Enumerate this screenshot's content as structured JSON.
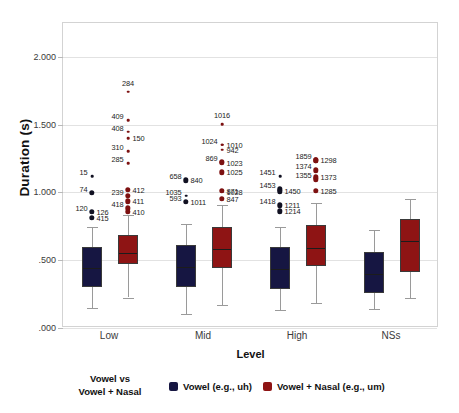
{
  "chart_data": {
    "type": "box",
    "title": "",
    "xlabel": "Level",
    "ylabel": "Duration (s)",
    "ylim": [
      0.0,
      2.25
    ],
    "yticks": [
      0.0,
      0.5,
      1.0,
      1.5,
      2.0
    ],
    "ytick_labels": [
      ".000",
      ".500",
      "1.000",
      "1.500",
      "2.000"
    ],
    "categories": [
      "Low",
      "Mid",
      "High",
      "NSs"
    ],
    "grid": true,
    "legend_position": "below-axis",
    "series": [
      {
        "name": "Vowel (e.g., uh)",
        "color": "#161642",
        "boxes": [
          {
            "category": "Low",
            "whisker_low": 0.145,
            "q1": 0.305,
            "median": 0.448,
            "q3": 0.595,
            "whisker_high": 0.745
          },
          {
            "category": "Mid",
            "whisker_low": 0.105,
            "q1": 0.3,
            "median": 0.455,
            "q3": 0.612,
            "whisker_high": 0.765
          },
          {
            "category": "High",
            "whisker_low": 0.135,
            "q1": 0.288,
            "median": 0.44,
            "q3": 0.598,
            "whisker_high": 0.745
          },
          {
            "category": "NSs",
            "whisker_low": 0.138,
            "q1": 0.258,
            "median": 0.408,
            "q3": 0.562,
            "whisker_high": 0.725
          }
        ]
      },
      {
        "name": "Vowel + Nasal (e.g., um)",
        "color": "#8e1414",
        "boxes": [
          {
            "category": "Low",
            "whisker_low": 0.225,
            "q1": 0.47,
            "median": 0.56,
            "q3": 0.688,
            "whisker_high": 0.832
          },
          {
            "category": "Mid",
            "whisker_low": 0.172,
            "q1": 0.442,
            "median": 0.592,
            "q3": 0.748,
            "whisker_high": 0.905
          },
          {
            "category": "High",
            "whisker_low": 0.182,
            "q1": 0.458,
            "median": 0.598,
            "q3": 0.762,
            "whisker_high": 0.925
          },
          {
            "category": "NSs",
            "whisker_low": 0.222,
            "q1": 0.412,
            "median": 0.652,
            "q3": 0.805,
            "whisker_high": 0.952
          }
        ]
      }
    ],
    "outliers": [
      {
        "group": "Low",
        "series": "Vowel",
        "label": "15",
        "value": 1.118,
        "size": "small",
        "label_side": "left"
      },
      {
        "group": "Low",
        "series": "Vowel",
        "label": "74",
        "value": 0.998,
        "size": "big",
        "label_side": "left"
      },
      {
        "group": "Low",
        "series": "Vowel",
        "label": "120",
        "value": 0.855,
        "size": "small",
        "label_side": "left"
      },
      {
        "group": "Low",
        "series": "Vowel",
        "label": "126",
        "value": 0.855,
        "size": "big",
        "label_side": "right"
      },
      {
        "group": "Low",
        "series": "Vowel",
        "label": "415",
        "value": 0.812,
        "size": "big",
        "label_side": "right"
      },
      {
        "group": "Low",
        "series": "Vowel + Nasal",
        "label": "284",
        "value": 1.742,
        "size": "small",
        "label_side": "center"
      },
      {
        "group": "Low",
        "series": "Vowel + Nasal",
        "label": "409",
        "value": 1.532,
        "size": "small",
        "label_side": "left"
      },
      {
        "group": "Low",
        "series": "Vowel + Nasal",
        "label": "408",
        "value": 1.448,
        "size": "small",
        "label_side": "left"
      },
      {
        "group": "Low",
        "series": "Vowel + Nasal",
        "label": "150",
        "value": 1.402,
        "size": "small",
        "label_side": "right"
      },
      {
        "group": "Low",
        "series": "Vowel + Nasal",
        "label": "310",
        "value": 1.305,
        "size": "small",
        "label_side": "left"
      },
      {
        "group": "Low",
        "series": "Vowel + Nasal",
        "label": "285",
        "value": 1.215,
        "size": "small",
        "label_side": "left"
      },
      {
        "group": "Low",
        "series": "Vowel + Nasal",
        "label": "412",
        "value": 1.018,
        "size": "big",
        "label_side": "right"
      },
      {
        "group": "Low",
        "series": "Vowel + Nasal",
        "label": "239",
        "value": 0.975,
        "size": "big",
        "label_side": "left"
      },
      {
        "group": "Low",
        "series": "Vowel + Nasal",
        "label": "411",
        "value": 0.935,
        "size": "big",
        "label_side": "right"
      },
      {
        "group": "Low",
        "series": "Vowel + Nasal",
        "label": "418",
        "value": 0.882,
        "size": "big",
        "label_side": "left"
      },
      {
        "group": "Low",
        "series": "Vowel + Nasal",
        "label": "410",
        "value": 0.858,
        "size": "big",
        "label_side": "right"
      },
      {
        "group": "Mid",
        "series": "Vowel",
        "label": "658",
        "value": 1.09,
        "size": "big",
        "label_side": "left"
      },
      {
        "group": "Mid",
        "series": "Vowel",
        "label": "593",
        "value": 0.932,
        "size": "big",
        "label_side": "left"
      },
      {
        "group": "Mid",
        "series": "Vowel",
        "label": "840",
        "value": 1.09,
        "size": "small",
        "label_side": "right"
      },
      {
        "group": "Mid",
        "series": "Vowel",
        "label": "1011",
        "value": 0.932,
        "size": "small",
        "label_side": "right"
      },
      {
        "group": "Mid",
        "series": "Vowel",
        "label": "1035",
        "value": 0.975,
        "size": "small",
        "label_side": "left"
      },
      {
        "group": "Mid",
        "series": "Vowel + Nasal",
        "label": "1016",
        "value": 1.505,
        "size": "small",
        "label_side": "center"
      },
      {
        "group": "Mid",
        "series": "Vowel + Nasal",
        "label": "1024",
        "value": 1.352,
        "size": "small",
        "label_side": "left"
      },
      {
        "group": "Mid",
        "series": "Vowel + Nasal",
        "label": "1010",
        "value": 1.352,
        "size": "small",
        "label_side": "right"
      },
      {
        "group": "Mid",
        "series": "Vowel + Nasal",
        "label": "942",
        "value": 1.315,
        "size": "small",
        "label_side": "right"
      },
      {
        "group": "Mid",
        "series": "Vowel + Nasal",
        "label": "869",
        "value": 1.228,
        "size": "big",
        "label_side": "left"
      },
      {
        "group": "Mid",
        "series": "Vowel + Nasal",
        "label": "1023",
        "value": 1.218,
        "size": "big",
        "label_side": "right"
      },
      {
        "group": "Mid",
        "series": "Vowel + Nasal",
        "label": "1025",
        "value": 1.148,
        "size": "big",
        "label_side": "right"
      },
      {
        "group": "Mid",
        "series": "Vowel + Nasal",
        "label": "871",
        "value": 1.012,
        "size": "big",
        "label_side": "right"
      },
      {
        "group": "Mid",
        "series": "Vowel + Nasal",
        "label": "1028",
        "value": 1.005,
        "size": "small",
        "label_side": "right"
      },
      {
        "group": "Mid",
        "series": "Vowel + Nasal",
        "label": "847",
        "value": 0.952,
        "size": "big",
        "label_side": "right"
      },
      {
        "group": "High",
        "series": "Vowel",
        "label": "1451",
        "value": 1.118,
        "size": "small",
        "label_side": "left"
      },
      {
        "group": "High",
        "series": "Vowel",
        "label": "1453",
        "value": 1.022,
        "size": "big",
        "label_side": "left"
      },
      {
        "group": "High",
        "series": "Vowel",
        "label": "1450",
        "value": 1.008,
        "size": "big",
        "label_side": "right"
      },
      {
        "group": "High",
        "series": "Vowel",
        "label": "1418",
        "value": 0.905,
        "size": "small",
        "label_side": "left"
      },
      {
        "group": "High",
        "series": "Vowel",
        "label": "1211",
        "value": 0.905,
        "size": "big",
        "label_side": "right"
      },
      {
        "group": "High",
        "series": "Vowel",
        "label": "1214",
        "value": 0.862,
        "size": "big",
        "label_side": "right"
      },
      {
        "group": "High",
        "series": "Vowel + Nasal",
        "label": "1859",
        "value": 1.238,
        "size": "big",
        "label_side": "left"
      },
      {
        "group": "High",
        "series": "Vowel + Nasal",
        "label": "1298",
        "value": 1.238,
        "size": "big",
        "label_side": "right"
      },
      {
        "group": "High",
        "series": "Vowel + Nasal",
        "label": "1374",
        "value": 1.162,
        "size": "big",
        "label_side": "left"
      },
      {
        "group": "High",
        "series": "Vowel + Nasal",
        "label": "1373",
        "value": 1.112,
        "size": "big",
        "label_side": "right"
      },
      {
        "group": "High",
        "series": "Vowel + Nasal",
        "label": "1355",
        "value": 1.098,
        "size": "big",
        "label_side": "left"
      },
      {
        "group": "High",
        "series": "Vowel + Nasal",
        "label": "1285",
        "value": 1.01,
        "size": "big",
        "label_side": "right"
      }
    ]
  },
  "axis": {
    "y_title": "Duration (s)",
    "x_title": "Level",
    "y_tick_labels": [
      ".000",
      ".500",
      "1.000",
      "1.500",
      "2.000"
    ],
    "x_tick_labels": [
      "Low",
      "Mid",
      "High",
      "NSs"
    ]
  },
  "legend": {
    "title_line1": "Vowel vs",
    "title_line2": "Vowel + Nasal",
    "entries": [
      {
        "label": "Vowel (e.g., uh)",
        "color": "#161642"
      },
      {
        "label": "Vowel + Nasal (e.g., um)",
        "color": "#8e1414"
      }
    ]
  }
}
